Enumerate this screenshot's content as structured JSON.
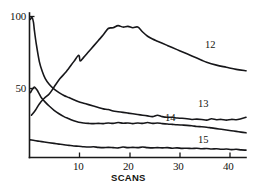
{
  "chart_data": {
    "type": "line",
    "title": "",
    "subtitle": "",
    "xlabel": "SCANS",
    "ylabel": "",
    "xlim": [
      0,
      44
    ],
    "ylim": [
      0,
      102
    ],
    "grid": false,
    "legend": "inline-end-labels",
    "x_ticks": [
      10,
      20,
      30,
      40
    ],
    "x_tick_labels": [
      "10",
      "20",
      "30",
      "40"
    ],
    "y_ticks": [
      50,
      100
    ],
    "y_tick_labels": [
      "50",
      "100"
    ],
    "series": [
      {
        "name": "12",
        "label": "12",
        "x": [
          0.4,
          1.2,
          2.0,
          3.0,
          4.0,
          5.0,
          6.2,
          7.5,
          9.0,
          10.0,
          10.3,
          11.0,
          12.0,
          13.0,
          14.0,
          15.0,
          16.0,
          17.0,
          18.0,
          19.0,
          20.0,
          21.0,
          22.0,
          23.0,
          24.0,
          25.0,
          26.0,
          27.0,
          28.0,
          29.0,
          30.0,
          31.0,
          32.0,
          33.0,
          34.0,
          35.0,
          36.0,
          38.0,
          40.0,
          42.0,
          44.0
        ],
        "y": [
          30.0,
          33.5,
          38.0,
          42.0,
          45.0,
          50.0,
          56.0,
          61.0,
          68.0,
          72.5,
          68.5,
          71.0,
          75.0,
          79.0,
          83.0,
          87.0,
          91.5,
          92.0,
          93.5,
          92.5,
          93.0,
          92.0,
          92.5,
          89.0,
          86.0,
          84.0,
          82.5,
          81.0,
          79.5,
          78.0,
          76.5,
          75.0,
          73.5,
          72.0,
          70.5,
          69.0,
          67.5,
          65.5,
          64.0,
          62.5,
          61.5
        ]
      },
      {
        "name": "13",
        "label": "13",
        "x": [
          0.2,
          0.5,
          0.8,
          1.0,
          1.4,
          2.0,
          2.6,
          3.2,
          4.0,
          5.0,
          6.0,
          7.0,
          8.0,
          9.0,
          10.0,
          11.0,
          12.0,
          13.0,
          14.0,
          15.0,
          16.0,
          17.0,
          18.0,
          19.0,
          20.0,
          21.0,
          22.0,
          23.0,
          24.0,
          25.0,
          26.0,
          27.0,
          28.0,
          29.0,
          30.0,
          31.0,
          32.0,
          33.0,
          34.0,
          35.0,
          36.0,
          37.0,
          38.0,
          39.0,
          40.0,
          41.0,
          42.0,
          43.0,
          44.0
        ],
        "y": [
          98.0,
          99.5,
          96.0,
          90.0,
          80.0,
          68.0,
          61.0,
          56.0,
          52.0,
          48.5,
          46.0,
          44.0,
          42.5,
          41.0,
          39.5,
          38.5,
          37.5,
          36.5,
          35.5,
          34.5,
          34.0,
          33.0,
          32.5,
          32.0,
          31.5,
          31.0,
          30.5,
          30.0,
          29.5,
          29.0,
          30.0,
          29.0,
          28.5,
          28.5,
          28.0,
          27.8,
          27.5,
          27.0,
          27.2,
          27.0,
          26.5,
          27.5,
          26.8,
          27.0,
          26.5,
          27.0,
          26.8,
          27.5,
          28.5
        ]
      },
      {
        "name": "14",
        "label": "14",
        "x": [
          0.2,
          0.6,
          1.0,
          1.5,
          2.0,
          2.5,
          3.0,
          4.0,
          5.0,
          6.0,
          7.0,
          8.0,
          9.0,
          10.0,
          11.0,
          12.0,
          13.0,
          14.0,
          15.0,
          16.0,
          17.0,
          18.0,
          19.0,
          20.0,
          21.0,
          22.0,
          23.0,
          24.0,
          25.0,
          26.0,
          27.0,
          28.0,
          29.0,
          30.0,
          31.0,
          32.0,
          33.0,
          34.0,
          35.0,
          36.0,
          37.0,
          38.0,
          39.0,
          40.0,
          41.0,
          42.0,
          43.0,
          44.0
        ],
        "y": [
          46.0,
          48.5,
          50.0,
          48.0,
          45.0,
          42.0,
          40.0,
          36.5,
          33.5,
          31.0,
          29.0,
          27.5,
          26.0,
          25.0,
          24.5,
          24.2,
          24.0,
          24.2,
          24.0,
          24.5,
          24.2,
          24.8,
          24.3,
          24.5,
          24.0,
          24.5,
          24.2,
          24.8,
          24.2,
          24.5,
          24.0,
          23.8,
          23.5,
          23.2,
          23.0,
          22.8,
          22.5,
          22.0,
          21.8,
          21.5,
          21.0,
          20.5,
          20.0,
          19.5,
          19.0,
          18.5,
          18.0,
          17.5
        ]
      },
      {
        "name": "15",
        "label": "15",
        "x": [
          0.2,
          1.0,
          2.0,
          3.0,
          4.0,
          5.0,
          6.0,
          7.0,
          8.0,
          9.0,
          10.0,
          11.0,
          12.0,
          13.0,
          14.0,
          15.0,
          16.0,
          17.0,
          18.0,
          19.0,
          20.0,
          21.0,
          22.0,
          23.0,
          24.0,
          25.0,
          26.0,
          27.0,
          28.0,
          29.0,
          30.0,
          31.0,
          32.0,
          33.0,
          34.0,
          35.0,
          36.0,
          37.0,
          38.0,
          39.0,
          40.0,
          41.0,
          42.0,
          43.0,
          44.0
        ],
        "y": [
          12.5,
          12.0,
          11.5,
          11.0,
          10.5,
          10.0,
          9.5,
          9.0,
          8.6,
          8.2,
          8.0,
          7.6,
          7.4,
          7.6,
          7.2,
          7.0,
          7.2,
          7.0,
          6.8,
          7.4,
          7.0,
          7.2,
          7.0,
          7.4,
          7.0,
          6.8,
          7.0,
          6.8,
          7.0,
          6.6,
          6.8,
          6.5,
          6.6,
          6.4,
          6.6,
          6.2,
          6.4,
          6.0,
          6.2,
          5.8,
          6.0,
          5.6,
          5.8,
          5.4,
          5.2
        ]
      }
    ],
    "series_label_positions": [
      {
        "name": "12",
        "x_px": 205,
        "y_px": 40
      },
      {
        "name": "13",
        "x_px": 198,
        "y_px": 99
      },
      {
        "name": "14",
        "x_px": 165,
        "y_px": 113
      },
      {
        "name": "15",
        "x_px": 198,
        "y_px": 135
      }
    ],
    "colors": {
      "curve": "#17171a",
      "axis": "#1a1a1a",
      "text": "#14140f",
      "background": "#ffffff"
    }
  }
}
